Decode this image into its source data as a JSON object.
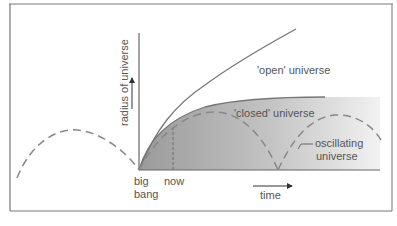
{
  "diagram": {
    "title": "",
    "axis": {
      "y_label": "radius of universe",
      "x_label": "time"
    },
    "markers": {
      "origin_label_line1": "big",
      "origin_label_line2": "bang",
      "now_label": "now"
    },
    "curves": {
      "open": "'open' universe",
      "closed": "'closed' universe",
      "oscillating_line1": "oscillating",
      "oscillating_line2": "universe"
    },
    "colors": {
      "frame": "#777777",
      "axis": "#666666",
      "curve": "#777777",
      "dashed": "#888888",
      "fill_dark": "#9a9a9a",
      "fill_light": "#f0f0f0",
      "text": "#555555"
    }
  }
}
